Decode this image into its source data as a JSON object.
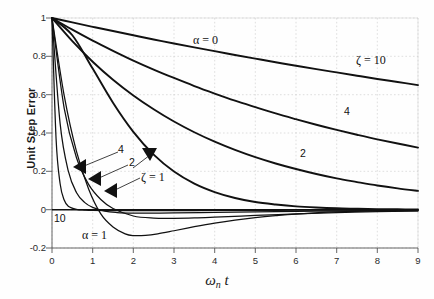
{
  "chart_data": {
    "type": "line",
    "title": "",
    "xlabel": "ωn t",
    "ylabel": "Unit Step Error",
    "xlim": [
      0,
      9
    ],
    "ylim": [
      -0.2,
      1.0
    ],
    "xticks": [
      "0",
      "1",
      "2",
      "3",
      "4",
      "5",
      "6",
      "7",
      "8",
      "9"
    ],
    "yticks": [
      "1",
      "0.8",
      "0.6",
      "0.4",
      "0.2",
      "0",
      "-0.2"
    ],
    "grid": true,
    "legend_position": "inline-annotations",
    "series": [
      {
        "name": "zeta = 10, alpha = 0",
        "label": "ζ = 10",
        "group": "alpha = 0",
        "x": [
          0,
          0.5,
          1,
          1.5,
          2,
          2.5,
          3,
          3.5,
          4,
          4.5,
          5,
          5.5,
          6,
          6.5,
          7,
          7.5,
          8,
          8.5,
          9
        ],
        "y": [
          1.0,
          0.977,
          0.954,
          0.932,
          0.91,
          0.888,
          0.867,
          0.847,
          0.827,
          0.807,
          0.788,
          0.769,
          0.751,
          0.733,
          0.716,
          0.699,
          0.682,
          0.666,
          0.65
        ]
      },
      {
        "name": "zeta = 4, alpha = 0",
        "label": "4",
        "group": "alpha = 0",
        "x": [
          0,
          0.5,
          1,
          1.5,
          2,
          2.5,
          3,
          3.5,
          4,
          4.5,
          5,
          5.5,
          6,
          6.5,
          7,
          7.5,
          8,
          8.5,
          9
        ],
        "y": [
          1.0,
          0.939,
          0.882,
          0.829,
          0.778,
          0.731,
          0.687,
          0.645,
          0.606,
          0.569,
          0.535,
          0.502,
          0.472,
          0.443,
          0.416,
          0.391,
          0.367,
          0.345,
          0.324
        ]
      },
      {
        "name": "zeta = 2, alpha = 0",
        "label": "2",
        "group": "alpha = 0",
        "x": [
          0,
          0.5,
          1,
          1.5,
          2,
          2.5,
          3,
          3.5,
          4,
          4.5,
          5,
          5.5,
          6,
          6.5,
          7,
          7.5,
          8,
          8.5,
          9
        ],
        "y": [
          1.0,
          0.879,
          0.772,
          0.678,
          0.596,
          0.524,
          0.46,
          0.404,
          0.355,
          0.312,
          0.274,
          0.241,
          0.212,
          0.186,
          0.163,
          0.144,
          0.126,
          0.111,
          0.098
        ]
      },
      {
        "name": "zeta = 1, alpha = 0",
        "label": "ζ = 1",
        "group": "alpha = 0",
        "x": [
          0,
          0.5,
          1,
          1.5,
          2,
          2.5,
          3,
          3.5,
          4,
          4.5,
          5,
          5.5,
          6,
          6.5,
          7,
          7.5,
          8,
          8.5,
          9
        ],
        "y": [
          1.0,
          0.91,
          0.736,
          0.558,
          0.406,
          0.287,
          0.199,
          0.136,
          0.092,
          0.061,
          0.04,
          0.027,
          0.017,
          0.011,
          0.007,
          0.005,
          0.003,
          0.002,
          0.001
        ]
      },
      {
        "name": "zeta = 10, alpha = 1",
        "label": "10",
        "group": "alpha = 1",
        "x": [
          0,
          0.1,
          0.2,
          0.3,
          0.4,
          0.6,
          0.8,
          1.0,
          1.5,
          2,
          3,
          4,
          5,
          6,
          7,
          8,
          9
        ],
        "y": [
          1.0,
          0.37,
          0.135,
          0.05,
          0.018,
          0.002,
          -0.002,
          -0.004,
          -0.005,
          -0.005,
          -0.005,
          -0.004,
          -0.004,
          -0.003,
          -0.003,
          -0.002,
          -0.002
        ]
      },
      {
        "name": "zeta = 4, alpha = 1",
        "label": "4",
        "group": "alpha = 1",
        "x": [
          0,
          0.2,
          0.4,
          0.6,
          0.8,
          1.0,
          1.3,
          1.6,
          2,
          2.5,
          3,
          4,
          5,
          6,
          7,
          8,
          9
        ],
        "y": [
          1.0,
          0.449,
          0.202,
          0.09,
          0.038,
          0.012,
          -0.008,
          -0.015,
          -0.018,
          -0.018,
          -0.017,
          -0.014,
          -0.011,
          -0.009,
          -0.007,
          -0.005,
          -0.004
        ]
      },
      {
        "name": "zeta = 2, alpha = 1",
        "label": "2",
        "group": "alpha = 1",
        "x": [
          0,
          0.3,
          0.6,
          0.9,
          1.2,
          1.5,
          2,
          2.5,
          3,
          3.5,
          4,
          5,
          6,
          7,
          8,
          9
        ],
        "y": [
          1.0,
          0.529,
          0.272,
          0.132,
          0.053,
          0.006,
          -0.033,
          -0.044,
          -0.045,
          -0.043,
          -0.039,
          -0.03,
          -0.022,
          -0.015,
          -0.01,
          -0.007
        ]
      },
      {
        "name": "zeta = 1, alpha = 1",
        "label": "ζ = 1",
        "group": "alpha = 1",
        "x": [
          0,
          0.3,
          0.6,
          0.9,
          1.2,
          1.5,
          1.8,
          2.0,
          2.3,
          2.6,
          3,
          3.5,
          4,
          4.5,
          5,
          5.5,
          6,
          7,
          8,
          9
        ],
        "y": [
          1.0,
          0.595,
          0.305,
          0.108,
          -0.022,
          -0.09,
          -0.126,
          -0.135,
          -0.134,
          -0.126,
          -0.11,
          -0.089,
          -0.07,
          -0.054,
          -0.041,
          -0.031,
          -0.023,
          -0.012,
          -0.006,
          -0.003
        ]
      }
    ],
    "annotations": [
      {
        "text": "α = 0",
        "x": 2.65,
        "y": 0.88
      },
      {
        "text": "ζ = 10",
        "x": 7.15,
        "y": 0.735
      },
      {
        "text": "4",
        "x": 6.95,
        "y": 0.455
      },
      {
        "text": "2",
        "x": 5.85,
        "y": 0.235
      },
      {
        "text": "4",
        "x": 1.32,
        "y": 0.275
      },
      {
        "text": "2",
        "x": 1.6,
        "y": 0.225
      },
      {
        "text": "ζ = 1",
        "x": 1.82,
        "y": 0.155
      },
      {
        "text": "10",
        "x": 0.22,
        "y": -0.055
      },
      {
        "text": "α = 1",
        "x": 0.8,
        "y": -0.135
      }
    ]
  },
  "labels": {
    "ytitle": "Unit Step Error",
    "xtitle_main": "ω",
    "xtitle_sub": "n",
    "xtitle_var": "t",
    "y": [
      "1",
      "0.8",
      "0.6",
      "0.4",
      "0.2",
      "0",
      "-0.2"
    ],
    "x": [
      "0",
      "1",
      "2",
      "3",
      "4",
      "5",
      "6",
      "7",
      "8",
      "9"
    ],
    "ann_alpha0": "α = 0",
    "ann_zeta10": "ζ = 10",
    "ann_four_right": "4",
    "ann_two_right": "2",
    "ann_four_left": "4",
    "ann_two_left": "2",
    "ann_zeta1": "ζ = 1",
    "ann_ten": "10",
    "ann_alpha1": "α = 1"
  }
}
